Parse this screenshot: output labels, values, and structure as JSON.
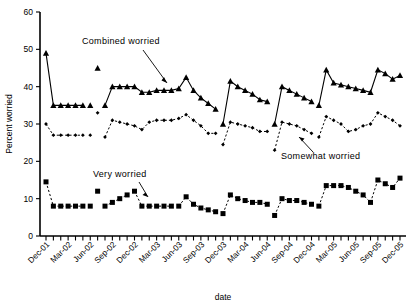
{
  "chart": {
    "type": "line",
    "title": "",
    "xlabel": "date",
    "ylabel": "Percent worried",
    "ylim": [
      0,
      60
    ],
    "ytick_values": [
      0,
      10,
      20,
      30,
      40,
      50,
      60
    ],
    "ytick_labels": [
      "0",
      "10",
      "20",
      "30",
      "40",
      "50",
      "60"
    ],
    "grid": false,
    "legend_position": "inline-annotations",
    "annotations": [
      {
        "id": "combined",
        "text": "Combined  worried"
      },
      {
        "id": "somewhat",
        "text": "Somewhat  worried"
      },
      {
        "id": "very",
        "text": "Very worried"
      }
    ],
    "xtick_labels": [
      "Dec-01",
      "Mar-02",
      "Jun-02",
      "Sep-02",
      "Dec-02",
      "Mar-03",
      "Jun-03",
      "Sep-03",
      "Dec-03",
      "Mar-04",
      "Jun-04",
      "Sep-04",
      "Dec-04",
      "Mar-05",
      "Jun-05",
      "Sep-05",
      "Dec-05"
    ],
    "xtick_label_indices": [
      0,
      3,
      6,
      9,
      12,
      15,
      18,
      21,
      24,
      27,
      30,
      33,
      36,
      39,
      42,
      45,
      48
    ],
    "x_count": 49
  },
  "chart_data": {
    "type": "line",
    "title": "",
    "xlabel": "date",
    "ylabel": "Percent worried",
    "ylim": [
      0,
      60
    ],
    "yticks": [
      0,
      10,
      20,
      30,
      40,
      50,
      60
    ],
    "grid": false,
    "legend_position": "inline-annotations",
    "x": [
      "Dec-01",
      "Jan-02",
      "Feb-02",
      "Mar-02",
      "Apr-02",
      "May-02",
      "Jun-02",
      "Jul-02",
      "Aug-02",
      "Sep-02",
      "Oct-02",
      "Nov-02",
      "Dec-02",
      "Jan-03",
      "Feb-03",
      "Mar-03",
      "Apr-03",
      "May-03",
      "Jun-03",
      "Jul-03",
      "Aug-03",
      "Sep-03",
      "Oct-03",
      "Nov-03",
      "Dec-03",
      "Jan-04",
      "Feb-04",
      "Mar-04",
      "Apr-04",
      "May-04",
      "Jun-04",
      "Jul-04",
      "Aug-04",
      "Sep-04",
      "Oct-04",
      "Nov-04",
      "Dec-04",
      "Jan-05",
      "Feb-05",
      "Mar-05",
      "Apr-05",
      "May-05",
      "Jun-05",
      "Jul-05",
      "Aug-05",
      "Sep-05",
      "Oct-05",
      "Nov-05",
      "Dec-05"
    ],
    "series": [
      {
        "name": "Combined worried",
        "marker": "triangle",
        "linestyle": "solid",
        "color": "#000000",
        "values": [
          49,
          35,
          35,
          35,
          35,
          35,
          35,
          45,
          35,
          40,
          40,
          40,
          40,
          38.5,
          38.5,
          39,
          39,
          39,
          39.5,
          42.5,
          39,
          37,
          35.5,
          34,
          30,
          41.5,
          40,
          39,
          38,
          36.5,
          36,
          30,
          40,
          39,
          38,
          37,
          36,
          35,
          44.5,
          41,
          40.5,
          40,
          39.5,
          39,
          38.5,
          44.5,
          43.5,
          42,
          43
        ]
      },
      {
        "name": "Somewhat worried",
        "marker": "diamond",
        "linestyle": "dashed",
        "color": "#000000",
        "values": [
          30,
          27,
          27,
          27,
          27,
          27,
          27,
          33,
          26.5,
          31,
          30.5,
          30,
          29.5,
          28.5,
          30.5,
          31,
          31,
          31,
          31.5,
          32.5,
          31,
          29.5,
          27.5,
          27.5,
          24.5,
          30.5,
          30,
          29.5,
          29,
          28,
          28,
          23,
          30.5,
          30,
          29.5,
          28.5,
          27.5,
          26.5,
          32,
          31,
          30,
          28,
          28.5,
          29.5,
          30,
          33,
          32,
          31,
          29.5
        ]
      },
      {
        "name": "Very worried",
        "marker": "square",
        "linestyle": "dashed",
        "color": "#000000",
        "values": [
          14.5,
          8,
          8,
          8,
          8,
          8,
          8,
          12,
          8,
          9,
          10,
          11,
          12,
          8,
          8,
          8,
          8,
          8,
          8,
          10.5,
          8.5,
          7.5,
          7,
          6.5,
          6,
          11,
          10,
          9.5,
          9,
          9,
          8.5,
          5.5,
          10,
          9.5,
          9.5,
          9,
          8.5,
          8,
          13.5,
          13.5,
          13.5,
          13,
          12,
          11,
          9,
          15,
          14,
          13,
          15.5
        ]
      }
    ]
  }
}
